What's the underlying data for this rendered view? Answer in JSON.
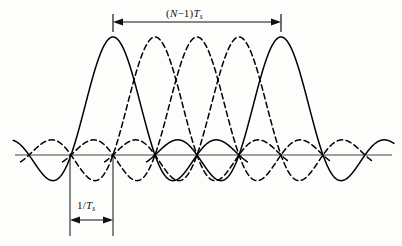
{
  "figure": {
    "background_color": "#fdfdfc",
    "axis_color": "#808080",
    "curve_color": "#000000"
  },
  "annotations": {
    "span_top": {
      "prefix": "(",
      "variable": "N",
      "minus": "−1",
      "suffix": ")",
      "symbol": "T",
      "subscript": "s",
      "full_text": "(N−1)Tₛ",
      "arrow_style": "double-headed",
      "x_start": 113,
      "x_end": 281,
      "y": 22
    },
    "span_bottom": {
      "numerator": "1",
      "slash": "/",
      "symbol": "T",
      "subscript": "s",
      "full_text": "1/Tₛ",
      "arrow_style": "double-headed",
      "x_start": 70,
      "x_end": 113,
      "y": 220
    }
  },
  "chart_data": {
    "type": "line",
    "title": "",
    "xlabel": "",
    "ylabel": "",
    "grid": false,
    "legend": false,
    "axis": {
      "x_pixel_start": 15,
      "x_pixel_end": 392,
      "y_pixel_baseline": 155,
      "node_spacing_px": 42,
      "first_node_px": 32
    },
    "series": [
      {
        "name": "subcarrier-1",
        "style": "solid",
        "center_px": 113,
        "peak_px_y": 37,
        "amplitude": 1.0
      },
      {
        "name": "subcarrier-2",
        "style": "dashed",
        "center_px": 155,
        "peak_px_y": 37,
        "amplitude": 1.0
      },
      {
        "name": "subcarrier-3",
        "style": "dashed",
        "center_px": 197,
        "peak_px_y": 37,
        "amplitude": 1.0
      },
      {
        "name": "subcarrier-4",
        "style": "dashed",
        "center_px": 239,
        "peak_px_y": 37,
        "amplitude": 1.0
      },
      {
        "name": "subcarrier-5",
        "style": "solid",
        "center_px": 281,
        "peak_px_y": 37,
        "amplitude": 1.0
      }
    ],
    "sinc_sample_count": 9,
    "x_range_lobes": [
      -3.2,
      3.2
    ],
    "ylim": [
      -0.25,
      1.05
    ]
  }
}
